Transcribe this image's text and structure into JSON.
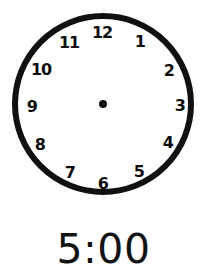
{
  "worksheet": {
    "background_color": "#ffffff",
    "ink_color": "#0d0d0d"
  },
  "clock": {
    "label": "analog-clock-face",
    "dial_color": "#ffffff",
    "outline_color": "#111111",
    "outline_width": 6,
    "center_x": 103,
    "center_y": 104,
    "radius": 88,
    "numeral_radius": 70,
    "hands_shown": false,
    "center_dot": {
      "label": "center-pivot-dot",
      "radius": 4,
      "color": "#111111"
    },
    "numerals": [
      {
        "label": "12",
        "angle_deg": 0,
        "x": 102,
        "y": 33
      },
      {
        "label": "1",
        "angle_deg": 30,
        "x": 140,
        "y": 42
      },
      {
        "label": "2",
        "angle_deg": 60,
        "x": 169,
        "y": 71
      },
      {
        "label": "3",
        "angle_deg": 90,
        "x": 180,
        "y": 106
      },
      {
        "label": "4",
        "angle_deg": 120,
        "x": 168,
        "y": 143
      },
      {
        "label": "5",
        "angle_deg": 150,
        "x": 139,
        "y": 172
      },
      {
        "label": "6",
        "angle_deg": 180,
        "x": 103,
        "y": 184
      },
      {
        "label": "7",
        "angle_deg": 210,
        "x": 70,
        "y": 173
      },
      {
        "label": "8",
        "angle_deg": 240,
        "x": 40,
        "y": 145
      },
      {
        "label": "9",
        "angle_deg": 270,
        "x": 32,
        "y": 107
      },
      {
        "label": "10",
        "angle_deg": 300,
        "x": 41,
        "y": 70
      },
      {
        "label": "11",
        "angle_deg": 330,
        "x": 69,
        "y": 43
      }
    ]
  },
  "digital": {
    "time_text": "5:00",
    "hour": "5",
    "minute": "00",
    "separator": ":"
  }
}
